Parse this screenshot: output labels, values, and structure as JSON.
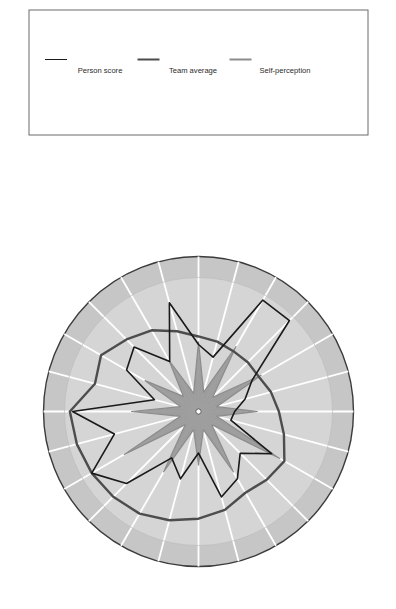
{
  "chart_data": {
    "type": "radar",
    "title": "",
    "xlabel": "",
    "ylabel": "",
    "ylim": [
      0,
      10
    ],
    "grid": true,
    "legend_position": "right",
    "orientation": "rotated-90-ccw",
    "radial_ticks": [
      "10",
      "9",
      "8",
      "7",
      "6",
      "5",
      "4",
      "3",
      "2",
      "1",
      "0"
    ],
    "categories": [
      "Introduction",
      "Sales person's conduct",
      "Meeting management",
      "Specifying customer needs",
      "Understanding challenges/pains",
      "Listening and questioning",
      "Company background",
      "Positioning the company",
      "Company offerings",
      "Matching customer pains to company offering",
      "Sales value proposition",
      "Anecdotes",
      "Marketplace understanding",
      "Differentiation from competition",
      "Product/service knowledge",
      "Next step/timescales",
      "Creating a solution on the fly",
      "Closing to the next stage",
      "Closing the deal",
      "Negotiation throughout the meeting",
      "Qualification of the meeting",
      "Meeting preparation",
      "Agenda setting",
      "Rapport"
    ],
    "series": [
      {
        "name": "Person score",
        "color": "#1a1a1a",
        "width": 1.6,
        "values": [
          9.4,
          3.4,
          6.2,
          6.8,
          4.3,
          8.4,
          5.0,
          4.2,
          9.6,
          9.6,
          4.6,
          3.6,
          2.7,
          2.5,
          6.3,
          4.4,
          5.8,
          6.6,
          3.1,
          5.2,
          4.0,
          7.6,
          9.2,
          6.5
        ]
      },
      {
        "name": "Team average",
        "color": "#4d4d4d",
        "width": 2.4,
        "values": [
          9.6,
          8.0,
          8.4,
          7.6,
          7.0,
          6.2,
          5.6,
          5.4,
          5.2,
          5.2,
          5.2,
          5.6,
          6.0,
          6.6,
          7.4,
          7.2,
          7.0,
          7.6,
          8.0,
          8.4,
          8.8,
          9.0,
          9.2,
          9.4
        ]
      },
      {
        "name": "Self-perception",
        "color": "#8c8c8c",
        "width": 1.2,
        "fill": "#9a9a9a",
        "values": [
          5.0,
          1.4,
          4.6,
          1.6,
          4.4,
          1.4,
          5.2,
          1.5,
          5.6,
          1.5,
          5.4,
          1.4,
          4.4,
          1.4,
          7.0,
          1.4,
          5.2,
          1.4,
          4.0,
          1.4,
          5.2,
          1.4,
          6.4,
          1.4
        ]
      }
    ]
  },
  "legend": {
    "items": [
      {
        "label": "Person score",
        "color": "#1a1a1a",
        "thickness": 1.6
      },
      {
        "label": "Team average",
        "color": "#4d4d4d",
        "thickness": 2.4
      },
      {
        "label": "Self-perception",
        "color": "#8c8c8c",
        "thickness": 2.6
      }
    ]
  },
  "colors": {
    "plot_background_outer": "#c9c9c9",
    "plot_background_inner": "#d6d6d6",
    "gridline": "#ffffff",
    "outer_ring_border": "#3b3b3b",
    "person_score": "#1a1a1a",
    "team_average": "#4d4d4d",
    "self_perception": "#8c8c8c"
  }
}
